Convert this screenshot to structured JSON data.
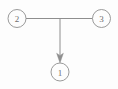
{
  "diagram": {
    "type": "directed-graph",
    "title": "",
    "background_color": "#fdfdfd",
    "stroke_color": "#8e8e8e",
    "label_color": "#6d6d6d",
    "canvas": {
      "width": 118,
      "height": 89
    },
    "nodes": [
      {
        "id": "1",
        "label": "1",
        "cx": 60,
        "cy": 72,
        "r": 9
      },
      {
        "id": "2",
        "label": "2",
        "cx": 17,
        "cy": 18.5,
        "r": 9
      },
      {
        "id": "3",
        "label": "3",
        "cx": 101.5,
        "cy": 18.5,
        "r": 9
      }
    ],
    "edges": [
      {
        "id": "edge-2-3",
        "from": "2",
        "to": "3",
        "directed": false,
        "label": "",
        "path": "M 26 18.5 L 92.5 18.5"
      },
      {
        "id": "edge-junction-1",
        "from": "2-3",
        "to": "1",
        "directed": true,
        "label": "",
        "path": "M 60 18.5 L 60 55",
        "arrow_points": "60,63 56.6,53.5 60,55.4 63.4,53.5"
      }
    ]
  }
}
